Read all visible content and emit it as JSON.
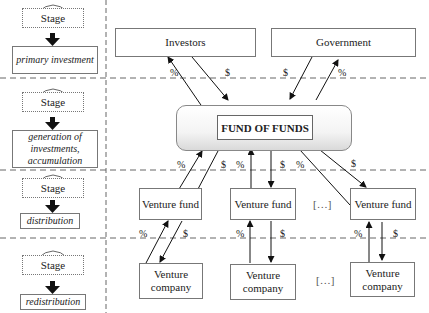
{
  "stages": [
    {
      "label": "Stage",
      "description": "primary investment"
    },
    {
      "label": "Stage",
      "description": "generation of investments, accumulation"
    },
    {
      "label": "Stage",
      "description": "distribution"
    },
    {
      "label": "Stage",
      "description": "redistribution"
    }
  ],
  "top_entities": {
    "investors": "Investors",
    "government": "Government"
  },
  "fund_of_funds": "FUND OF FUNDS",
  "venture_funds": [
    "Venture fund",
    "Venture fund",
    "Venture fund"
  ],
  "venture_companies": [
    "Venture company",
    "Venture company",
    "Venture company"
  ],
  "ellipsis": "[…]",
  "flow_symbols": {
    "percent": "%",
    "dollar": "$"
  }
}
